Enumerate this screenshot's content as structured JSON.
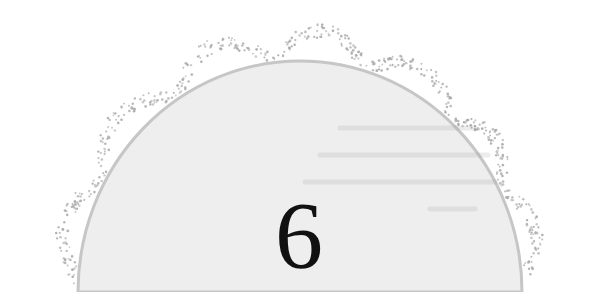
{
  "chapter": {
    "number": "6"
  },
  "colors": {
    "fill": "#eeeeee",
    "outline": "#c6c6c6",
    "dots": "#a9a9a9",
    "number": "#111111",
    "background": "#ffffff"
  }
}
